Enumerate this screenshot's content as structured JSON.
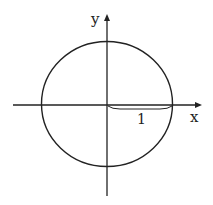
{
  "diagram": {
    "axes": {
      "x_label": "x",
      "y_label": "y"
    },
    "radius_label": "1",
    "colors": {
      "stroke": "#222222",
      "background": "#ffffff"
    }
  }
}
